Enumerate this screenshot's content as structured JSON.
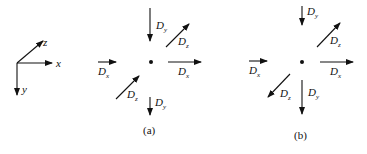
{
  "axes": {
    "x_label": "x",
    "y_label": "y",
    "z_label": "z"
  },
  "panel_a": {
    "caption": "(a)",
    "labels": {
      "dy_top": "D",
      "dy_top_sub": "y",
      "dz_top": "D",
      "dz_top_sub": "z",
      "dx_right": "D",
      "dx_right_sub": "x",
      "dx_left": "D",
      "dx_left_sub": "x",
      "dz_bottom": "D",
      "dz_bottom_sub": "z",
      "dy_bottom": "D",
      "dy_bottom_sub": "y"
    }
  },
  "panel_b": {
    "caption": "(b)",
    "labels": {
      "dy_top": "D",
      "dy_top_sub": "y",
      "dz_top": "D",
      "dz_top_sub": "z",
      "dx_right": "D",
      "dx_right_sub": "x",
      "dx_left": "D",
      "dx_left_sub": "x",
      "dz_bottom": "D",
      "dz_bottom_sub": "z",
      "dy_bottom": "D",
      "dy_bottom_sub": "y"
    }
  },
  "colors": {
    "stroke": "#111111",
    "background": "#ffffff"
  }
}
